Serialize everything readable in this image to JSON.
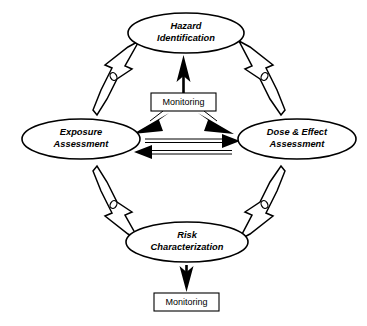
{
  "diagram": {
    "background_color": "#ffffff",
    "line_color": "#000000",
    "nodes": [
      {
        "id": "hazard-identification",
        "line1": "Hazard",
        "line2": "Identification",
        "shape": "ellipse",
        "position": "top"
      },
      {
        "id": "exposure-assessment",
        "line1": "Exposure",
        "line2": "Assessment",
        "shape": "ellipse",
        "position": "left"
      },
      {
        "id": "dose-effect-assessment",
        "line1": "Dose & Effect",
        "line2": "Assessment",
        "shape": "ellipse",
        "position": "right"
      },
      {
        "id": "risk-characterization",
        "line1": "Risk",
        "line2": "Characterization",
        "shape": "ellipse",
        "position": "bottom"
      }
    ],
    "boxes": [
      {
        "id": "monitoring-center",
        "label": "Monitoring",
        "shape": "rectangle",
        "position": "center"
      },
      {
        "id": "monitoring-bottom",
        "label": "Monitoring",
        "shape": "rectangle",
        "position": "bottom"
      }
    ],
    "connectors": [
      {
        "id": "monitoring-to-hazard",
        "style": "solid-black-arrow",
        "from": "monitoring-center",
        "to": "hazard-identification",
        "direction": "up"
      },
      {
        "id": "monitoring-to-exposure",
        "style": "solid-black-arrow",
        "from": "monitoring-center",
        "to": "exposure-assessment",
        "direction": "down-left"
      },
      {
        "id": "monitoring-to-dose-effect",
        "style": "solid-black-arrow",
        "from": "monitoring-center",
        "to": "dose-effect-assessment",
        "direction": "down-right"
      },
      {
        "id": "exposure-to-dose-effect",
        "style": "solid-black-arrow",
        "from": "exposure-assessment",
        "to": "dose-effect-assessment",
        "direction": "right"
      },
      {
        "id": "dose-effect-to-exposure",
        "style": "solid-black-arrow",
        "from": "dose-effect-assessment",
        "to": "exposure-assessment",
        "direction": "left"
      },
      {
        "id": "risk-to-monitoring",
        "style": "solid-black-arrow",
        "from": "risk-characterization",
        "to": "monitoring-bottom",
        "direction": "down"
      },
      {
        "id": "exposure-to-hazard",
        "style": "hollow-3d-arrow",
        "from": "exposure-assessment",
        "to": "hazard-identification",
        "direction": "up-right"
      },
      {
        "id": "hazard-to-dose-effect",
        "style": "hollow-3d-arrow",
        "from": "hazard-identification",
        "to": "dose-effect-assessment",
        "direction": "down-right"
      },
      {
        "id": "exposure-to-risk",
        "style": "hollow-3d-arrow",
        "from": "exposure-assessment",
        "to": "risk-characterization",
        "direction": "down-right"
      },
      {
        "id": "dose-effect-to-risk",
        "style": "hollow-3d-arrow",
        "from": "dose-effect-assessment",
        "to": "risk-characterization",
        "direction": "down-left"
      }
    ]
  }
}
